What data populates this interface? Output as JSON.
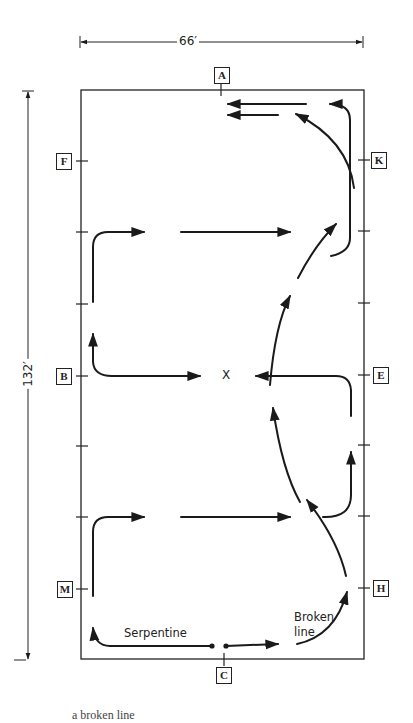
{
  "dimensions": {
    "width_label": "66′",
    "length_label": "132′"
  },
  "markers": {
    "A": "A",
    "K": "K",
    "E": "E",
    "H": "H",
    "C": "C",
    "M": "M",
    "B": "B",
    "F": "F"
  },
  "center_point": "X",
  "annotations": {
    "serpentine": "Serpentine",
    "broken_line_1": "Broken",
    "broken_line_2": "line"
  },
  "caption": "a broken line"
}
